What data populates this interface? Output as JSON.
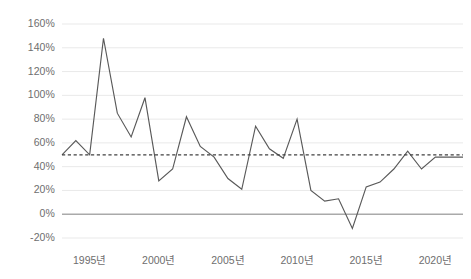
{
  "chart_data": {
    "type": "line",
    "title": "",
    "xlabel": "",
    "ylabel": "",
    "ylim": [
      -20,
      160
    ],
    "xlim": [
      1993,
      2022
    ],
    "grid": true,
    "legend": false,
    "y_ticks": [
      160,
      140,
      120,
      100,
      80,
      60,
      40,
      20,
      0,
      -20
    ],
    "y_tick_labels": [
      "160%",
      "140%",
      "120%",
      "100%",
      "80%",
      "60%",
      "40%",
      "20%",
      "0%",
      "-20%"
    ],
    "x_ticks": [
      1995,
      2000,
      2005,
      2010,
      2015,
      2020
    ],
    "x_tick_labels": [
      "1995년",
      "2000년",
      "2005년",
      "2010년",
      "2015년",
      "2020년"
    ],
    "series": [
      {
        "name": "series-1",
        "type": "line",
        "color": "#595959",
        "x": [
          1993,
          1994,
          1995,
          1996,
          1997,
          1998,
          1999,
          2000,
          2001,
          2002,
          2003,
          2004,
          2005,
          2006,
          2007,
          2008,
          2009,
          2010,
          2011,
          2012,
          2013,
          2014,
          2015,
          2016,
          2017,
          2018,
          2019,
          2020,
          2021,
          2022
        ],
        "values": [
          50,
          62,
          50,
          148,
          85,
          65,
          98,
          28,
          38,
          82,
          57,
          48,
          30,
          21,
          74,
          55,
          47,
          80,
          20,
          11,
          13,
          -12,
          23,
          27,
          38,
          53,
          38,
          48,
          48,
          48
        ]
      }
    ],
    "reference_line": {
      "name": "average-reference",
      "value": 50,
      "label": "",
      "style": "dashed",
      "color": "#404040"
    },
    "zero_line": {
      "value": 0,
      "color": "#aaaaaa"
    },
    "colors": {
      "line": "#595959",
      "grid": "#e9e9e9",
      "zero_axis": "#b0b0b0",
      "reference": "#3d3d3d",
      "tick_text": "#6e6e6e",
      "background": "#ffffff"
    }
  }
}
